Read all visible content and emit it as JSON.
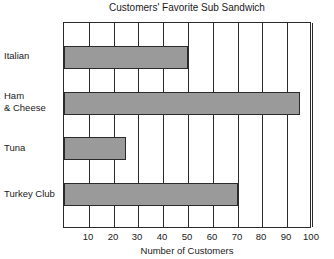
{
  "chart_data": {
    "type": "bar",
    "orientation": "horizontal",
    "title": "Customers' Favorite Sub Sandwich",
    "xlabel": "Number of Customers",
    "ylabel": "",
    "categories": [
      "Italian",
      "Ham\n& Cheese",
      "Tuna",
      "Turkey Club"
    ],
    "values": [
      50,
      95,
      25,
      70
    ],
    "xlim": [
      0,
      100
    ],
    "xticks": [
      10,
      20,
      30,
      40,
      50,
      60,
      70,
      80,
      90,
      100
    ],
    "xtick_labels": [
      "10",
      "20",
      "30",
      "40",
      "50",
      "60",
      "70",
      "80",
      "90",
      "100"
    ],
    "grid": "vertical",
    "legend": "none",
    "bar_color": "#9a9a9a",
    "bar_edge_color": "#2b2b2b",
    "axis_color": "#2b2b2b",
    "background_color": "#ffffff",
    "series": [
      {
        "name": "Number of Customers",
        "points": [
          {
            "category": "Italian",
            "value": 50
          },
          {
            "category": "Ham & Cheese",
            "value": 95
          },
          {
            "category": "Tuna",
            "value": 25
          },
          {
            "category": "Turkey Club",
            "value": 70
          }
        ]
      }
    ]
  }
}
